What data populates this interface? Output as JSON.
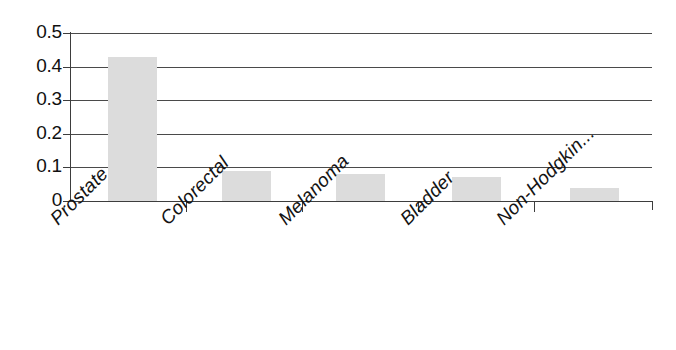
{
  "chart_data": {
    "type": "bar",
    "title": "",
    "subtitle": "",
    "xlabel": "",
    "ylabel": "",
    "categories": [
      "Prostate",
      "Colorectal",
      "Melanoma",
      "Bladder",
      "Non-Hodgkin..."
    ],
    "values": [
      0.43,
      0.09,
      0.08,
      0.07,
      0.04
    ],
    "series": [
      {
        "name": "",
        "values": [
          0.43,
          0.09,
          0.08,
          0.07,
          0.04
        ]
      }
    ],
    "ylim": [
      0,
      0.5
    ],
    "ytick_labels": [
      "0.5",
      "0.4",
      "0.3",
      "0.2",
      "0.1",
      "0"
    ],
    "ytick_values": [
      0.5,
      0.4,
      0.3,
      0.2,
      0.1,
      0
    ],
    "grid": true,
    "grid_axis": "y",
    "legend": false,
    "legend_position": "none",
    "bar_color": "#dcdcdc",
    "axis_color": "#3d3d3d",
    "gridline_color": "#4a4a4a",
    "background_color": "#ffffff",
    "xtick_label_rotation": -45
  }
}
